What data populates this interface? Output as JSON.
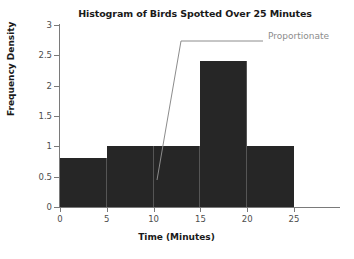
{
  "chart_data": {
    "type": "bar",
    "title": "Histogram of Birds Spotted Over 25 Minutes",
    "xlabel": "Time (Minutes)",
    "ylabel": "Frequency Density",
    "categories": [
      "0-5",
      "5-10",
      "10-15",
      "15-20",
      "20-25"
    ],
    "bin_edges": [
      0,
      5,
      10,
      15,
      20,
      25
    ],
    "values": [
      0.8,
      1.0,
      1.0,
      2.4,
      1.0
    ],
    "xlim": [
      0,
      25
    ],
    "ylim": [
      0,
      3
    ],
    "x_ticks": [
      "0",
      "5",
      "10",
      "15",
      "20",
      "25"
    ],
    "y_ticks": [
      "0",
      "0.5",
      "1",
      "1.5",
      "2",
      "2.5",
      "3"
    ],
    "grid": false,
    "legend": "none",
    "bar_color": "#262626",
    "axis_color": "#7a7a7a",
    "annotations": [
      {
        "text": "Proportionate",
        "color": "#8c8c8c",
        "points_to_bin": "10-15"
      }
    ]
  }
}
